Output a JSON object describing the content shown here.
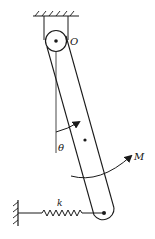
{
  "diagram": {
    "type": "mechanics-free-body",
    "labels": {
      "pivot": "O",
      "angle": "θ",
      "moment": "M",
      "spring": "k"
    },
    "colors": {
      "stroke": "#1a1a1a",
      "background": "#ffffff"
    }
  }
}
